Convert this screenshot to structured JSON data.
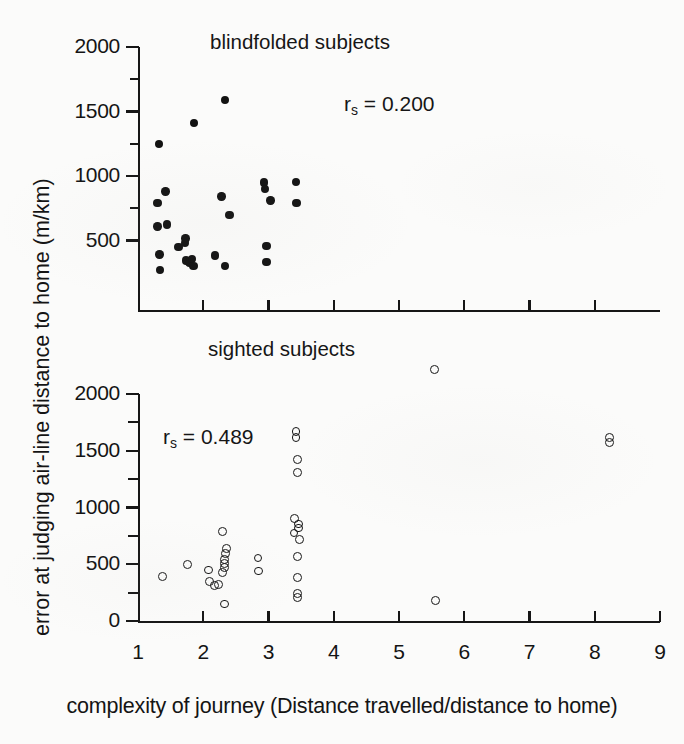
{
  "figure": {
    "axis_titles": {
      "y": "error at judging air-line distance to home (m/km)",
      "x": "complexity of journey (Distance travelled/distance to home)"
    },
    "xaxis": {
      "ticks": [
        "1",
        "2",
        "3",
        "4",
        "5",
        "6",
        "7",
        "8",
        "9"
      ],
      "min": 1,
      "max": 9
    },
    "panels": [
      {
        "id": "blindfolded",
        "title": "blindfolded subjects",
        "annotation_prefix": "r",
        "annotation_sub": "s",
        "annotation_value": "= 0.200",
        "yticks": [
          "2000",
          "1500",
          "1000",
          "500"
        ]
      },
      {
        "id": "sighted",
        "title": "sighted subjects",
        "annotation_prefix": "r",
        "annotation_sub": "s",
        "annotation_value": "= 0.489",
        "yticks": [
          "2000",
          "1500",
          "1000",
          "500",
          "0"
        ]
      }
    ]
  },
  "chart_data": [
    {
      "type": "scatter",
      "title": "blindfolded subjects",
      "xlabel": "complexity of journey (Distance travelled/distance to home)",
      "ylabel": "error at judging air-line distance to home (m/km)",
      "marker": "filled-circle",
      "annotation": "r_s = 0.200",
      "correlation_rs": 0.2,
      "xlim": [
        1,
        9
      ],
      "ylim": [
        150,
        2000
      ],
      "xticks": [
        1,
        2,
        3,
        4,
        5,
        6,
        7,
        8,
        9
      ],
      "yticks": [
        500,
        1000,
        1500,
        2000
      ],
      "grid": false,
      "legend": "none",
      "points": [
        {
          "x": 1.32,
          "y": 1250
        },
        {
          "x": 1.3,
          "y": 790
        },
        {
          "x": 1.42,
          "y": 880
        },
        {
          "x": 1.3,
          "y": 610
        },
        {
          "x": 1.44,
          "y": 625
        },
        {
          "x": 1.33,
          "y": 390
        },
        {
          "x": 1.34,
          "y": 270
        },
        {
          "x": 1.62,
          "y": 450
        },
        {
          "x": 1.86,
          "y": 1410
        },
        {
          "x": 1.72,
          "y": 480
        },
        {
          "x": 1.73,
          "y": 515
        },
        {
          "x": 1.74,
          "y": 345
        },
        {
          "x": 1.79,
          "y": 330
        },
        {
          "x": 1.83,
          "y": 355
        },
        {
          "x": 1.85,
          "y": 300
        },
        {
          "x": 2.18,
          "y": 385
        },
        {
          "x": 2.33,
          "y": 1590
        },
        {
          "x": 2.28,
          "y": 840
        },
        {
          "x": 2.4,
          "y": 700
        },
        {
          "x": 2.33,
          "y": 300
        },
        {
          "x": 2.93,
          "y": 950
        },
        {
          "x": 2.95,
          "y": 900
        },
        {
          "x": 3.03,
          "y": 810
        },
        {
          "x": 2.97,
          "y": 455
        },
        {
          "x": 2.97,
          "y": 335
        },
        {
          "x": 3.42,
          "y": 955
        },
        {
          "x": 3.43,
          "y": 790
        }
      ]
    },
    {
      "type": "scatter",
      "title": "sighted subjects",
      "xlabel": "complexity of journey (Distance travelled/distance to home)",
      "ylabel": "error at judging air-line distance to home (m/km)",
      "marker": "open-circle",
      "annotation": "r_s = 0.489",
      "correlation_rs": 0.489,
      "xlim": [
        1,
        9
      ],
      "ylim": [
        0,
        2000
      ],
      "xticks": [
        1,
        2,
        3,
        4,
        5,
        6,
        7,
        8,
        9
      ],
      "yticks": [
        0,
        500,
        1000,
        1500,
        2000
      ],
      "minor_yticks": [
        250,
        750,
        1250,
        1750
      ],
      "grid": false,
      "legend": "none",
      "points": [
        {
          "x": 1.37,
          "y": 390
        },
        {
          "x": 1.76,
          "y": 495
        },
        {
          "x": 2.08,
          "y": 450
        },
        {
          "x": 2.1,
          "y": 350
        },
        {
          "x": 2.17,
          "y": 315
        },
        {
          "x": 2.23,
          "y": 320
        },
        {
          "x": 2.3,
          "y": 430
        },
        {
          "x": 2.33,
          "y": 470
        },
        {
          "x": 2.33,
          "y": 510
        },
        {
          "x": 2.33,
          "y": 545
        },
        {
          "x": 2.34,
          "y": 595
        },
        {
          "x": 2.36,
          "y": 640
        },
        {
          "x": 2.3,
          "y": 790
        },
        {
          "x": 2.33,
          "y": 150
        },
        {
          "x": 2.84,
          "y": 555
        },
        {
          "x": 2.85,
          "y": 440
        },
        {
          "x": 3.42,
          "y": 1670
        },
        {
          "x": 3.42,
          "y": 1620
        },
        {
          "x": 3.44,
          "y": 1420
        },
        {
          "x": 3.44,
          "y": 1310
        },
        {
          "x": 3.4,
          "y": 900
        },
        {
          "x": 3.46,
          "y": 855
        },
        {
          "x": 3.46,
          "y": 820
        },
        {
          "x": 3.39,
          "y": 775
        },
        {
          "x": 3.47,
          "y": 720
        },
        {
          "x": 3.45,
          "y": 565
        },
        {
          "x": 3.45,
          "y": 380
        },
        {
          "x": 3.45,
          "y": 245
        },
        {
          "x": 3.45,
          "y": 205
        },
        {
          "x": 5.55,
          "y": 2215
        },
        {
          "x": 5.56,
          "y": 180
        },
        {
          "x": 8.22,
          "y": 1620
        },
        {
          "x": 8.22,
          "y": 1575
        }
      ]
    }
  ]
}
